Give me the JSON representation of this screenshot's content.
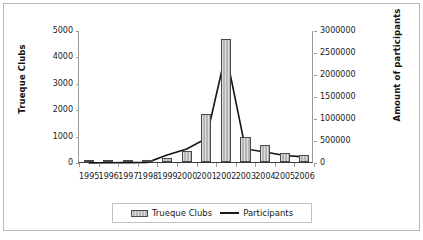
{
  "chart_data": {
    "type": "bar",
    "title": "",
    "subtitle": "",
    "xlabel": "",
    "ylabel": "Trueque Clubs",
    "y2label": "Amount of participants",
    "categories": [
      "1995",
      "1996",
      "1997",
      "1998",
      "1999",
      "2000",
      "2001",
      "2002",
      "2003",
      "2004",
      "2005",
      "2006"
    ],
    "ylim": [
      0,
      5000
    ],
    "y2lim": [
      0,
      3000000
    ],
    "yticks": [
      "0",
      "1000",
      "2000",
      "3000",
      "4000",
      "5000"
    ],
    "y2ticks": [
      "0",
      "500000",
      "1000000",
      "1500000",
      "2000000",
      "2500000",
      "3000000"
    ],
    "grid": false,
    "legend_position": "bottom",
    "series": [
      {
        "name": "Trueque Clubs",
        "type": "bar",
        "axis": "left",
        "values": [
          5,
          20,
          15,
          40,
          160,
          400,
          1800,
          4650,
          960,
          640,
          360,
          280
        ]
      },
      {
        "name": "Participants",
        "type": "line",
        "axis": "right",
        "values": [
          2000,
          5000,
          8000,
          15000,
          180000,
          320000,
          560000,
          2500000,
          320000,
          250000,
          170000,
          140000
        ]
      }
    ]
  },
  "legend": {
    "entries": [
      {
        "label": "Trueque Clubs",
        "marker": "bar-swatch"
      },
      {
        "label": "Participants",
        "marker": "line-swatch"
      }
    ]
  }
}
